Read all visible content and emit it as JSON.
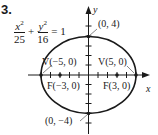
{
  "problem_number": "3.",
  "equation": {
    "term1": {
      "numerator_var": "x",
      "numerator_exp": "2",
      "denominator": "25"
    },
    "plus": "+",
    "term2": {
      "numerator_var": "y",
      "numerator_exp": "2",
      "denominator": "16"
    },
    "equals": "= 1"
  },
  "axes": {
    "x_label": "x",
    "y_label": "y"
  },
  "labels": {
    "top": "(0, 4)",
    "bottom": "(0, −4)",
    "vertex_left": "V(−5, 0)",
    "vertex_right": "V(5, 0)",
    "focus_left": "F(−3, 0)",
    "focus_right": "F(3, 0)"
  },
  "colors": {
    "stroke": "#1a1a1a",
    "background": "#ffffff"
  }
}
